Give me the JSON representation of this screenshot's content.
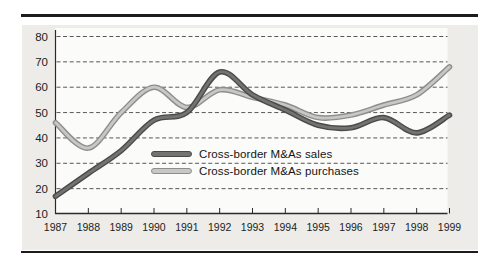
{
  "figure": {
    "background_color": "#ffffff",
    "panel_color": "#edece9",
    "plot_interior_color": "#fbfbf9",
    "rule_color": "#1c1c1c",
    "gridline_color": "#454545",
    "axis_color": "#2a2a2a"
  },
  "chart_data": {
    "type": "line",
    "x": [
      1987,
      1988,
      1989,
      1990,
      1991,
      1992,
      1993,
      1994,
      1995,
      1996,
      1997,
      1998,
      1999
    ],
    "series": [
      {
        "name": "Cross-border M&As sales",
        "values": [
          17,
          26,
          35,
          47,
          50,
          66,
          57,
          51,
          45,
          44,
          48,
          42,
          49
        ],
        "core_color": "#737373",
        "edge_color": "#4a4a4a"
      },
      {
        "name": "Cross-border M&As purchases",
        "values": [
          46,
          36,
          50,
          60,
          52,
          59,
          56,
          53,
          48,
          49,
          53,
          57,
          68
        ],
        "core_color": "#c7c7c4",
        "edge_color": "#8e8e8e"
      }
    ],
    "title": "",
    "xlabel": "",
    "ylabel": "",
    "ylim": [
      10,
      80
    ],
    "yticks": [
      10,
      20,
      30,
      40,
      50,
      60,
      70,
      80
    ],
    "xtick_labels": [
      "1987",
      "1988",
      "1989",
      "1990",
      "1991",
      "1992",
      "1993",
      "1994",
      "1995",
      "1996",
      "1997",
      "1998",
      "1999"
    ],
    "grid": "horizontal-dashed",
    "legend_position": "inside-center"
  },
  "legend": {
    "items": [
      {
        "label": "Cross-border M&As sales"
      },
      {
        "label": "Cross-border M&As purchases"
      }
    ]
  }
}
